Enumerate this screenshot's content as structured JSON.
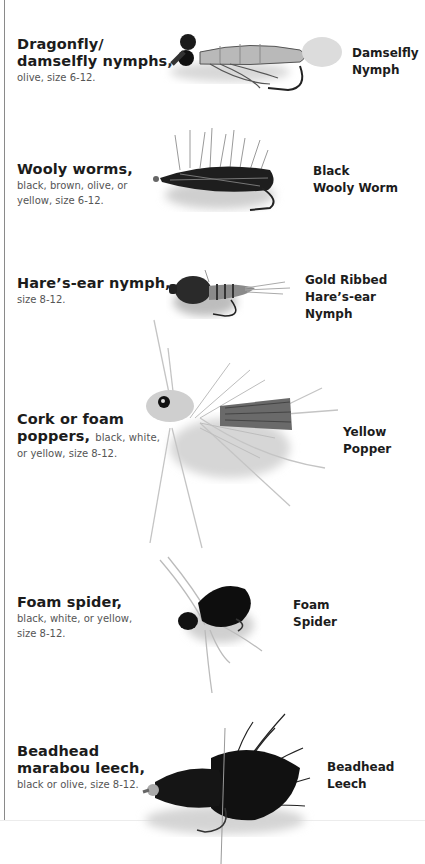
{
  "entries": [
    {
      "title": "Dragonfly/ damselfly nymphs,",
      "title_line1": "Dragonfly/",
      "title_line2": "damselfly nymphs,",
      "description": "olive, size 6-12.",
      "fly_label_line1": "Damselfly",
      "fly_label_line2": "Nymph",
      "image": "damselfly-nymph-image"
    },
    {
      "title": "Wooly worms,",
      "description_line1": "black, brown, olive, or",
      "description_line2": "yellow, size 6-12.",
      "fly_label_line1": "Black",
      "fly_label_line2": "Wooly Worm",
      "image": "black-wooly-worm-image"
    },
    {
      "title": "Hare's-ear nymph,",
      "title_display": "Hare’s-ear nymph,",
      "description": "size 8-12.",
      "fly_label_line1": "Gold Ribbed",
      "fly_label_line2": "Hare’s-ear Nymph",
      "image": "gold-ribbed-hares-ear-nymph-image"
    },
    {
      "title_line1": "Cork or foam",
      "title_line2": "poppers,",
      "description_inline": "black, white,",
      "description_line2": "or yellow, size 8-12.",
      "fly_label": "Yellow Popper",
      "image": "yellow-popper-image"
    },
    {
      "title": "Foam spider,",
      "description_line1": "black, white, or yellow,",
      "description_line2": "size 8-12.",
      "fly_label_line1": "Foam",
      "fly_label_line2": "Spider",
      "image": "foam-spider-image"
    },
    {
      "title_line1": "Beadhead",
      "title_line2": "marabou leech,",
      "description": "black or olive, size 8-12.",
      "fly_label_line1": "Beadhead",
      "fly_label_line2": "Leech",
      "image": "beadhead-leech-image"
    }
  ]
}
